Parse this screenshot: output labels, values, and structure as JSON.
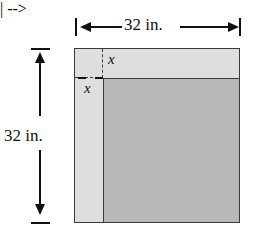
{
  "figure": {
    "type": "geometry-diagram",
    "background_color": "#ffffff",
    "outer_square": {
      "name": "outer-square",
      "side_label": "32 in.",
      "side_value": 32,
      "units": "in.",
      "fill_color": "#dedede",
      "stroke_color": "#3a3a3a"
    },
    "inner_rect": {
      "name": "inner-rectangle",
      "fill_color": "#b8b8b8",
      "stroke_color": "#3a3a3a"
    },
    "dimensions": {
      "top": {
        "label": "32 in.",
        "value": 32,
        "units": "in."
      },
      "left": {
        "label": "32 in.",
        "value": 32,
        "units": "in."
      }
    },
    "variables": {
      "x_top": "x",
      "x_left": "x"
    },
    "icons": {
      "arrow_left": "arrow-left-icon",
      "arrow_right": "arrow-right-icon",
      "arrow_up": "arrow-up-icon",
      "arrow_down": "arrow-down-icon"
    }
  }
}
